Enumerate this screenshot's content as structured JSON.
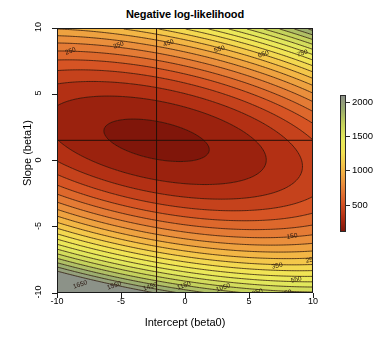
{
  "chart_data": {
    "type": "contour",
    "title": "Negative log-likelihood",
    "xlabel": "Intercept (beta0)",
    "ylabel": "Slope (beta1)",
    "xlim": [
      -10,
      10
    ],
    "ylim": [
      -10,
      10
    ],
    "xticks": [
      "-10",
      "-5",
      "0",
      "5",
      "10"
    ],
    "xtick_values": [
      -10,
      -5,
      0,
      5,
      10
    ],
    "yticks": [
      "10",
      "5",
      "0",
      "-5",
      "-10"
    ],
    "ytick_values": [
      10,
      5,
      0,
      -5,
      -10
    ],
    "grid": false,
    "colorbar": {
      "ticks": [
        "2000",
        "1500",
        "1000",
        "500"
      ],
      "tick_values": [
        2000,
        1500,
        1000,
        500
      ],
      "vmin": 100,
      "vmax": 2100,
      "position": "right",
      "colors_low_to_high": [
        "#8c1a0c",
        "#cf4f22",
        "#e8873a",
        "#f4c64a",
        "#ecec5c",
        "#c8d45a",
        "#9aab6e",
        "#8f9488"
      ]
    },
    "contour_interval": 100,
    "contour_levels": [
      150,
      250,
      350,
      450,
      550,
      650,
      750,
      850,
      950,
      1050,
      1150,
      1250,
      1350,
      1450,
      1550,
      1650,
      1850
    ],
    "crosshair": {
      "beta0": -2.3,
      "beta1": 1.6
    },
    "contour_labels": [
      {
        "text": "250",
        "x": 6,
        "y": 20,
        "rot": -20
      },
      {
        "text": "350",
        "x": 54,
        "y": 14,
        "rot": -20
      },
      {
        "text": "450",
        "x": 104,
        "y": 12,
        "rot": -20
      },
      {
        "text": "550",
        "x": 155,
        "y": 18,
        "rot": -18
      },
      {
        "text": "650",
        "x": 199,
        "y": 23,
        "rot": -18
      },
      {
        "text": "750",
        "x": 238,
        "y": 22,
        "rot": -18
      },
      {
        "text": "850",
        "x": 278,
        "y": 21,
        "rot": -18
      },
      {
        "text": "150",
        "x": 228,
        "y": 204,
        "rot": -10
      },
      {
        "text": "250",
        "x": 247,
        "y": 228,
        "rot": -13
      },
      {
        "text": "350",
        "x": 213,
        "y": 234,
        "rot": -13
      },
      {
        "text": "450",
        "x": 269,
        "y": 249,
        "rot": -15
      },
      {
        "text": "550",
        "x": 232,
        "y": 248,
        "rot": -15
      },
      {
        "text": "650",
        "x": 280,
        "y": 265,
        "rot": -18
      },
      {
        "text": "750",
        "x": 251,
        "y": 263,
        "rot": -18
      },
      {
        "text": "850",
        "x": 222,
        "y": 262,
        "rot": -18
      },
      {
        "text": "950",
        "x": 193,
        "y": 261,
        "rot": -18
      },
      {
        "text": "1050",
        "x": 157,
        "y": 257,
        "rot": -18
      },
      {
        "text": "1150",
        "x": 118,
        "y": 255,
        "rot": -18
      },
      {
        "text": "1250",
        "x": 106,
        "y": 272,
        "rot": -18
      },
      {
        "text": "1350",
        "x": 68,
        "y": 270,
        "rot": -18
      },
      {
        "text": "1450",
        "x": 84,
        "y": 256,
        "rot": -18
      },
      {
        "text": "1550",
        "x": 48,
        "y": 255,
        "rot": -18
      },
      {
        "text": "1650",
        "x": 14,
        "y": 254,
        "rot": -18
      },
      {
        "text": "1850",
        "x": 8,
        "y": 272,
        "rot": -15
      }
    ]
  }
}
